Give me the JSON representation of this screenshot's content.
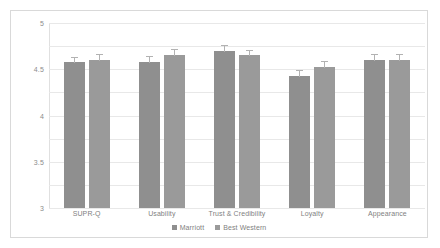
{
  "chart_data": {
    "type": "bar",
    "title": "",
    "subtitle": "",
    "xlabel": "",
    "ylabel": "",
    "ylim": [
      1,
      5
    ],
    "ytick_labels": [
      "5",
      "4.5",
      "4",
      "3.5",
      "3",
      "2.5",
      "2",
      "1.5",
      "1"
    ],
    "ytick_values": [
      5,
      4.5,
      4,
      3.5,
      3,
      2.5,
      2,
      1.5,
      1
    ],
    "grid": true,
    "legend_position": "bottom",
    "categories": [
      "SUPR-Q",
      "Usability",
      "Trust & Credibility",
      "Loyalty",
      "Appearance"
    ],
    "series": [
      {
        "name": "Marriott",
        "color": "#8f8f8f",
        "values": [
          4.15,
          4.15,
          4.4,
          3.85,
          4.2
        ],
        "errors": [
          0.12,
          0.13,
          0.12,
          0.13,
          0.12
        ]
      },
      {
        "name": "Best Western",
        "color": "#9a9a9a",
        "values": [
          4.2,
          4.3,
          4.3,
          4.05,
          4.2
        ],
        "errors": [
          0.13,
          0.14,
          0.12,
          0.13,
          0.13
        ]
      }
    ]
  }
}
